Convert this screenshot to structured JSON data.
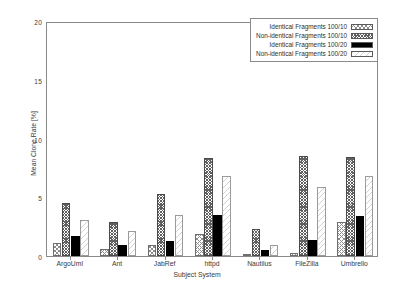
{
  "chart_data": {
    "type": "bar",
    "title": "",
    "xlabel": "Subject System",
    "ylabel": "Mean Clone Rate [%]",
    "ylim": [
      0,
      20
    ],
    "yticks": [
      0,
      5,
      10,
      15,
      20
    ],
    "grid": false,
    "legend_position": "top-right",
    "categories": [
      "ArgoUml",
      "Ant",
      "JabRef",
      "httpd",
      "Nautilus",
      "FileZilla",
      "Umbrello"
    ],
    "series": [
      {
        "name": "Identical Fragments 100/10",
        "pattern": "sparse-cross-hatch",
        "values": [
          1.1,
          0.6,
          0.9,
          1.9,
          0.2,
          0.25,
          2.9
        ]
      },
      {
        "name": "Non-identical Fragments 100/10",
        "pattern": "dense-cross-hatch",
        "values": [
          4.5,
          2.9,
          5.3,
          8.3,
          2.3,
          8.5,
          8.4
        ]
      },
      {
        "name": "Identical Fragments 100/20",
        "pattern": "solid-black",
        "values": [
          1.7,
          0.9,
          1.3,
          3.5,
          0.55,
          1.4,
          3.4
        ]
      },
      {
        "name": "Non-identical Fragments 100/20",
        "pattern": "light-diagonal",
        "values": [
          3.1,
          2.1,
          3.5,
          6.8,
          0.95,
          5.9,
          6.8
        ]
      }
    ]
  },
  "axis": {
    "y_tick_labels": [
      "0",
      "5",
      "10",
      "15",
      "20"
    ],
    "x_tick_labels": [
      "ArgoUml",
      "Ant",
      "JabRef",
      "httpd",
      "Nautilus",
      "FileZilla",
      "Umbrello"
    ],
    "y_axis_title": "Mean Clone Rate [%]",
    "x_axis_title": "Subject System"
  },
  "legend": {
    "entries": [
      "Identical Fragments 100/10",
      "Non-identical Fragments 100/10",
      "Identical Fragments 100/20",
      "Non-identical Fragments 100/20"
    ]
  },
  "colors": {
    "frame": "#8a8a8a",
    "text": "#3a3a3a",
    "series_solid": "#000000"
  }
}
